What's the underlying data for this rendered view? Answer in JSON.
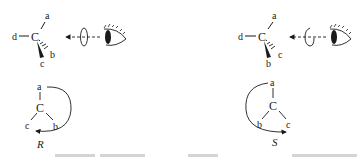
{
  "diagram": {
    "left_panel": {
      "config_label": "R",
      "perspective": {
        "center": "C",
        "left": "d",
        "top": "a",
        "wedge": "c",
        "hash": "b"
      },
      "projection": {
        "center": "C",
        "top": "a",
        "bottom_left": "c",
        "bottom_right": "b",
        "rotation": "clockwise"
      },
      "viewer": {
        "icon": "eye-icon",
        "arrow": "dashed-arrow-left",
        "rotation_marker": "rotation-loop-icon"
      }
    },
    "right_panel": {
      "config_label": "S",
      "perspective": {
        "center": "C",
        "left": "d",
        "top": "a",
        "wedge": "b",
        "hash": "c"
      },
      "projection": {
        "center": "C",
        "top": "a",
        "bottom_left": "b",
        "bottom_right": "c",
        "rotation": "counterclockwise"
      },
      "viewer": {
        "icon": "eye-icon",
        "arrow": "dashed-arrow-left",
        "rotation_marker": "rotation-loop-icon"
      }
    },
    "colors": {
      "ink": "#1a1a1a",
      "background": "#ffffff"
    }
  }
}
